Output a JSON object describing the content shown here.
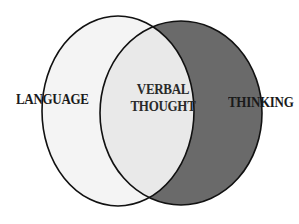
{
  "diagram": {
    "type": "venn",
    "sets": [
      {
        "name": "language",
        "label": "LANGUAGE",
        "fill": "#f4f4f4"
      },
      {
        "name": "thinking",
        "label": "THINKING",
        "fill": "#6a6a6a"
      }
    ],
    "intersection": {
      "label_line1": "VERBAL",
      "label_line2": "THOUGHT",
      "fill": "#e9e9e9"
    },
    "outline_color": "#111111",
    "background": "#ffffff"
  }
}
